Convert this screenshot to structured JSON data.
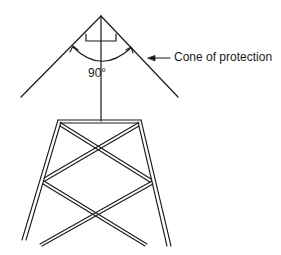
{
  "diagram": {
    "labels": {
      "angle": "90°",
      "cone": "Cone of protection"
    },
    "colors": {
      "stroke": "#1a1a1a",
      "background": "#ffffff"
    }
  }
}
